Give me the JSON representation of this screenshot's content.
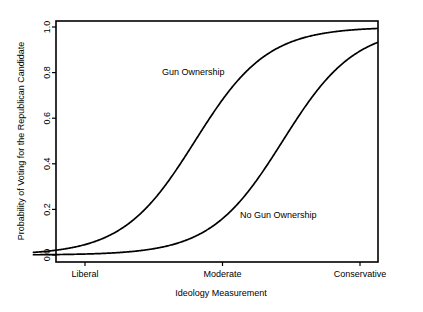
{
  "chart_data": {
    "type": "line",
    "title": "",
    "xlabel": "Ideology Measurement",
    "ylabel": "Probability of Voting for the Republican Candidate",
    "xlim": [
      0,
      10
    ],
    "ylim": [
      0.0,
      1.0
    ],
    "grid": false,
    "legend_position": "inline-annotation",
    "x_tick_labels": [
      "Liberal",
      "Moderate",
      "Conservative"
    ],
    "x_tick_values": [
      1.5,
      5.5,
      9.5
    ],
    "y_tick_labels": [
      "0.0",
      "0.2",
      "0.4",
      "0.6",
      "0.8",
      "1.0"
    ],
    "y_tick_values": [
      0.0,
      0.2,
      0.4,
      0.6,
      0.8,
      1.0
    ],
    "series": [
      {
        "name": "Gun Ownership",
        "color": "#000000",
        "midpoint_x": 4.7,
        "slope": 0.95,
        "x": [
          0.0,
          0.5,
          1.0,
          1.5,
          2.0,
          2.5,
          3.0,
          3.5,
          4.0,
          4.5,
          5.0,
          5.5,
          6.0,
          6.5,
          7.0,
          7.5,
          8.0,
          8.5,
          9.0,
          9.5,
          10.0
        ],
        "values": [
          0.012,
          0.019,
          0.03,
          0.047,
          0.073,
          0.111,
          0.166,
          0.241,
          0.337,
          0.45,
          0.569,
          0.681,
          0.776,
          0.848,
          0.899,
          0.934,
          0.957,
          0.972,
          0.982,
          0.989,
          0.993
        ]
      },
      {
        "name": "No Gun Ownership",
        "color": "#000000",
        "midpoint_x": 7.25,
        "slope": 0.95,
        "x": [
          0.0,
          0.5,
          1.0,
          1.5,
          2.0,
          2.5,
          3.0,
          3.5,
          4.0,
          4.5,
          5.0,
          5.5,
          6.0,
          6.5,
          7.0,
          7.5,
          8.0,
          8.5,
          9.0,
          9.5,
          10.0
        ],
        "values": [
          0.001,
          0.002,
          0.003,
          0.005,
          0.008,
          0.012,
          0.019,
          0.031,
          0.049,
          0.077,
          0.119,
          0.18,
          0.263,
          0.366,
          0.481,
          0.597,
          0.701,
          0.787,
          0.852,
          0.9,
          0.934
        ]
      }
    ],
    "annotations": [
      {
        "text": "Gun Ownership",
        "x_px": 162,
        "y_px": 75
      },
      {
        "text": "No Gun Ownership",
        "x_px": 240,
        "y_px": 218
      }
    ]
  },
  "figure": {
    "background_color": "#ffffff",
    "frame_color": "#000000",
    "line_color": "#000000"
  }
}
